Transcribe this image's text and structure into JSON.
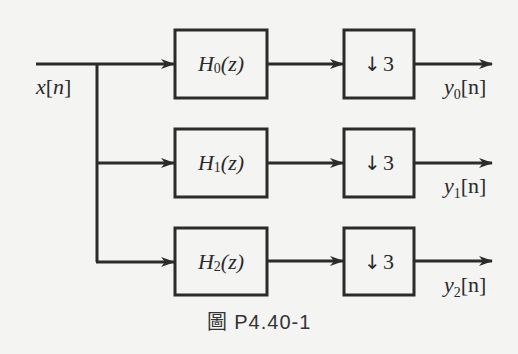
{
  "input": {
    "var": "x",
    "index": "n"
  },
  "branches": [
    {
      "filter_name": "H",
      "filter_sub": "0",
      "filter_arg": "(z)",
      "down_glyph": "↓",
      "factor": "3",
      "out_var": "y",
      "out_sub": "0",
      "out_index": "[n]"
    },
    {
      "filter_name": "H",
      "filter_sub": "1",
      "filter_arg": "(z)",
      "down_glyph": "↓",
      "factor": "3",
      "out_var": "y",
      "out_sub": "1",
      "out_index": "[n]"
    },
    {
      "filter_name": "H",
      "filter_sub": "2",
      "filter_arg": "(z)",
      "down_glyph": "↓",
      "factor": "3",
      "out_var": "y",
      "out_sub": "2",
      "out_index": "[n]"
    }
  ],
  "caption": "圖 P4.40-1",
  "colors": {
    "line": "#2b2b2b",
    "background": "#f4f4f2"
  }
}
